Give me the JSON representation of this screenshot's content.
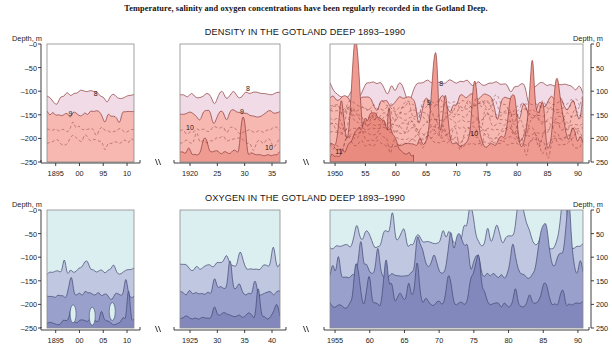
{
  "caption": "Temperature, salinity and oxygen concentrations have been regularly recorded in the Gotland Deep.",
  "density_section": {
    "title": "DENSITY IN THE GOTLAND DEEP 1893–1990",
    "axis_label_left": "Depth, m",
    "axis_label_right": "Depth, m",
    "y_labels_left": [
      "–0",
      "–50",
      "–100",
      "–150",
      "–200",
      "–250"
    ],
    "y_labels_right": [
      "0",
      "50",
      "100",
      "150",
      "200",
      "250"
    ],
    "panels": [
      {
        "name": "density-panel-1",
        "x_ticks": [
          "1895",
          "00",
          "95",
          "10"
        ],
        "contour_labels": [
          {
            "text": "8",
            "x": 0.56,
            "y": 0.44
          },
          {
            "text": "9",
            "x": 0.27,
            "y": 0.61
          }
        ]
      },
      {
        "name": "density-panel-2",
        "x_ticks": [
          "1920",
          "25",
          "30",
          "35"
        ],
        "contour_labels": [
          {
            "text": "8",
            "x": 0.68,
            "y": 0.4
          },
          {
            "text": "9",
            "x": 0.62,
            "y": 0.59
          },
          {
            "text": "10",
            "x": 0.1,
            "y": 0.73
          },
          {
            "text": "10",
            "x": 0.89,
            "y": 0.9
          }
        ]
      },
      {
        "name": "density-panel-3",
        "x_ticks": [
          "1950",
          "55",
          "60",
          "65",
          "70",
          "75",
          "80",
          "85",
          "90"
        ],
        "contour_labels": [
          {
            "text": "8",
            "x": 0.44,
            "y": 0.36
          },
          {
            "text": "9",
            "x": 0.39,
            "y": 0.52
          },
          {
            "text": "10",
            "x": 0.57,
            "y": 0.78
          },
          {
            "text": "11",
            "x": 0.035,
            "y": 0.93
          }
        ]
      }
    ]
  },
  "oxygen_section": {
    "title": "OXYGEN IN THE GOTLAND DEEP 1893–1990",
    "axis_label_left": "Depth, m",
    "axis_label_right": "Depth, m",
    "y_labels_left": [
      "–0",
      "–50",
      "–100",
      "–150",
      "–200",
      "–250"
    ],
    "y_labels_right": [
      "0",
      "50",
      "100",
      "150",
      "200",
      "250"
    ],
    "panels": [
      {
        "name": "oxygen-panel-1",
        "x_ticks": [
          "1895",
          "00",
          "05",
          "10"
        ]
      },
      {
        "name": "oxygen-panel-2",
        "x_ticks": [
          "1925",
          "30",
          "35",
          "40"
        ]
      },
      {
        "name": "oxygen-panel-3",
        "x_ticks": [
          "1955",
          "60",
          "65",
          "70",
          "75",
          "80",
          "85",
          "90"
        ]
      }
    ]
  },
  "colors": {
    "background": "#ffffff",
    "plot_background": "#ffffff",
    "density_band_light": "#f0dbe6",
    "density_band_mid": "#f6b8b0",
    "density_band_deep": "#f09b92",
    "density_band_deepest": "#ea8b80",
    "density_contour": "#8c3b3b",
    "oxygen_band_light": "#dbeef0",
    "oxygen_band_mid": "#bfc8e0",
    "oxygen_band_deep": "#9aa0cc",
    "oxygen_band_deepest": "#8288bc",
    "oxygen_contour": "#3f4870",
    "axis": "#2b2b2b",
    "frame": "#8a8a8a"
  },
  "chart_data": {
    "type": "area",
    "ylabel": "Depth, m",
    "ylim": [
      -250,
      0
    ],
    "grid": false,
    "legend": "none",
    "charts": [
      {
        "name": "density",
        "title": "DENSITY IN THE GOTLAND DEEP 1893–1990",
        "contour_levels": [
          8,
          9,
          10,
          11
        ],
        "segments": [
          {
            "x_range": [
              1893,
              1910
            ],
            "ticks": [
              1895,
              1900,
              1905,
              1910
            ]
          },
          {
            "x_range": [
              1918,
              1938
            ],
            "ticks": [
              1920,
              1925,
              1930,
              1935
            ]
          },
          {
            "x_range": [
              1948,
              1990
            ],
            "ticks": [
              1950,
              1955,
              1960,
              1965,
              1970,
              1975,
              1980,
              1985,
              1990
            ]
          }
        ],
        "isoline_depths_m": {
          "level_8": [
            -105,
            -110,
            -108,
            -112,
            -105,
            -95,
            -85
          ],
          "level_9": [
            -150,
            -148,
            -152,
            -145,
            -150,
            -160,
            -140
          ],
          "level_10": [
            -215,
            -230,
            -225,
            -240,
            -200,
            -195,
            -185
          ],
          "level_11": [
            -245,
            -240,
            -235
          ]
        }
      },
      {
        "name": "oxygen",
        "title": "OXYGEN IN THE GOTLAND DEEP 1893–1990",
        "contour_levels": [
          1,
          2,
          3
        ],
        "segments": [
          {
            "x_range": [
              1893,
              1910
            ],
            "ticks": [
              1895,
              1900,
              1905,
              1910
            ]
          },
          {
            "x_range": [
              1922,
              1940
            ],
            "ticks": [
              1925,
              1930,
              1935,
              1940
            ]
          },
          {
            "x_range": [
              1953,
              1990
            ],
            "ticks": [
              1955,
              1960,
              1965,
              1970,
              1975,
              1980,
              1985,
              1990
            ]
          }
        ],
        "isoline_depths_m": {
          "level_1": [
            -130,
            -125,
            -120,
            -115,
            -70,
            -75,
            -80
          ],
          "level_2": [
            -175,
            -170,
            -180,
            -150,
            -100,
            -110,
            -120
          ],
          "level_3": [
            -220,
            -215,
            -230,
            -200,
            -180,
            -190
          ]
        }
      }
    ]
  }
}
